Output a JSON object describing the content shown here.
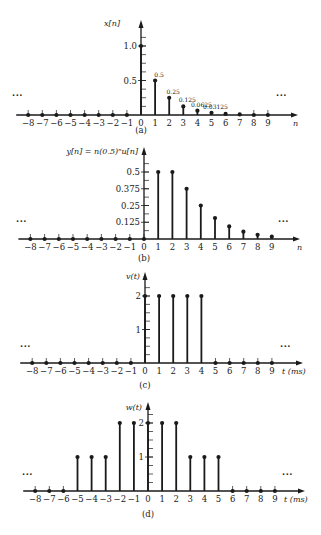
{
  "figure": {
    "ellipsis": "···",
    "colors": {
      "ink": "#1a1a1a",
      "background": "#ffffff"
    }
  },
  "chart_data": [
    {
      "type": "stem",
      "panel": "(a)",
      "title": "",
      "ylabel": "x[n]",
      "xlabel": "n",
      "x": [
        -8,
        -7,
        -6,
        -5,
        -4,
        -3,
        -2,
        -1,
        0,
        1,
        2,
        3,
        4,
        5,
        6,
        7,
        8,
        9
      ],
      "values": [
        0,
        0,
        0,
        0,
        0,
        0,
        0,
        0,
        1.0,
        0.5,
        0.25,
        0.125,
        0.0625,
        0.03125,
        0.015625,
        0.0078125,
        0,
        0
      ],
      "ytick_labels": [
        {
          "v": 1.0,
          "label": "1.0"
        },
        {
          "v": 0.5,
          "label": "0.5"
        }
      ],
      "value_labels": [
        {
          "n": 1,
          "label": "0.5"
        },
        {
          "n": 2,
          "label": "0.25"
        },
        {
          "n": 3,
          "label": "0.125"
        },
        {
          "n": 4,
          "label": "0.0625"
        },
        {
          "n": 5,
          "label": "0.03125"
        }
      ],
      "ylim": [
        0,
        1.3
      ],
      "ellipsis_left": true,
      "ellipsis_right": true,
      "layout": {
        "axisX": 141,
        "baseY": 115,
        "topY": 20,
        "unitPx": 69,
        "step": 14.1,
        "n0x": 141,
        "arrowEnd": 298,
        "xlabelX": 293,
        "capY": 133,
        "ytickStep": 0.125,
        "ellipsisY": 98,
        "ellipsisLx": 12,
        "ellipsisRx": 276,
        "ylabX": 120,
        "ylabY": 26
      }
    },
    {
      "type": "stem",
      "panel": "(b)",
      "title": "",
      "ylabel": "y[n] = n(0.5)ⁿu[n]",
      "xlabel": "n",
      "x": [
        -8,
        -7,
        -6,
        -5,
        -4,
        -3,
        -2,
        -1,
        0,
        1,
        2,
        3,
        4,
        5,
        6,
        7,
        8,
        9
      ],
      "values": [
        0,
        0,
        0,
        0,
        0,
        0,
        0,
        0,
        0,
        0.5,
        0.5,
        0.375,
        0.25,
        0.15625,
        0.09375,
        0.0546875,
        0.03125,
        0.017578
      ],
      "ytick_labels": [
        {
          "v": 0.5,
          "label": "0.5"
        },
        {
          "v": 0.375,
          "label": "0.375"
        },
        {
          "v": 0.25,
          "label": "0.25"
        },
        {
          "v": 0.125,
          "label": "0.125"
        }
      ],
      "value_labels": [],
      "ylim": [
        0,
        0.65
      ],
      "ellipsis_left": true,
      "ellipsis_right": true,
      "layout": {
        "axisX": 144,
        "baseY": 239,
        "topY": 147,
        "unitPx": 134,
        "step": 14.2,
        "n0x": 144,
        "arrowEnd": 300,
        "xlabelX": 297,
        "capY": 261,
        "ytickStep": 0.0625,
        "ellipsisY": 224,
        "ellipsisLx": 16,
        "ellipsisRx": 278,
        "ylabX": 138,
        "ylabY": 154
      }
    },
    {
      "type": "stem",
      "panel": "(c)",
      "title": "",
      "ylabel": "v(t)",
      "xlabel": "t (ms)",
      "x": [
        -8,
        -7,
        -6,
        -5,
        -4,
        -3,
        -2,
        -1,
        0,
        1,
        2,
        3,
        4,
        5,
        6,
        7,
        8,
        9
      ],
      "values": [
        0,
        0,
        0,
        0,
        0,
        0,
        0,
        0,
        2,
        2,
        2,
        2,
        2,
        0,
        0,
        0,
        0,
        0
      ],
      "ytick_labels": [
        {
          "v": 2,
          "label": "2"
        },
        {
          "v": 1,
          "label": "1"
        }
      ],
      "value_labels": [],
      "ylim": [
        0,
        2.6
      ],
      "ellipsis_left": true,
      "ellipsis_right": true,
      "layout": {
        "axisX": 145,
        "baseY": 363,
        "topY": 272,
        "unitPx": 33.5,
        "step": 14.1,
        "n0x": 145,
        "arrowEnd": 303,
        "xlabelX": 282,
        "capY": 388,
        "ytickStep": 0.25,
        "ellipsisY": 349,
        "ellipsisLx": 20,
        "ellipsisRx": 280,
        "ylabX": 140,
        "ylabY": 279
      }
    },
    {
      "type": "stem",
      "panel": "(d)",
      "title": "",
      "ylabel": "w(t)",
      "xlabel": "t (ms)",
      "x": [
        -8,
        -7,
        -6,
        -5,
        -4,
        -3,
        -2,
        -1,
        0,
        1,
        2,
        3,
        4,
        5,
        6,
        7,
        8,
        9
      ],
      "values": [
        0,
        0,
        0,
        1,
        1,
        1,
        2,
        2,
        2,
        2,
        2,
        1,
        1,
        1,
        0,
        0,
        0,
        0
      ],
      "ytick_labels": [
        {
          "v": 2,
          "label": "2"
        },
        {
          "v": 1,
          "label": "1"
        }
      ],
      "value_labels": [],
      "ylim": [
        0,
        2.6
      ],
      "ellipsis_left": true,
      "ellipsis_right": true,
      "layout": {
        "axisX": 148,
        "baseY": 491,
        "topY": 402,
        "unitPx": 34,
        "step": 14.1,
        "n0x": 148,
        "arrowEnd": 305,
        "xlabelX": 284,
        "capY": 517,
        "ytickStep": 0.25,
        "ellipsisY": 477,
        "ellipsisLx": 22,
        "ellipsisRx": 282,
        "ylabX": 142,
        "ylabY": 410
      }
    }
  ]
}
